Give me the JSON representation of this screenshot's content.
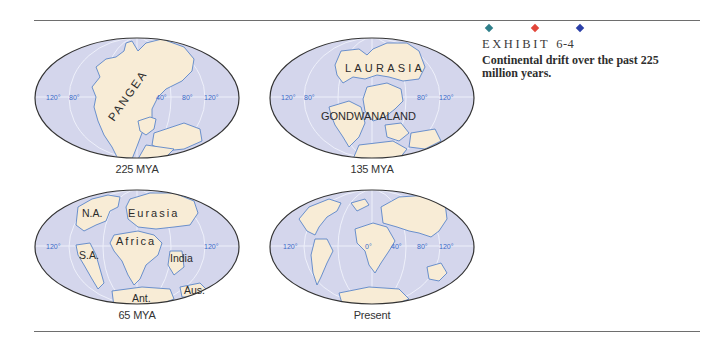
{
  "exhibit": {
    "label": "EXHIBIT",
    "number": "6-4",
    "caption": "Continental drift over the past 225 million years.",
    "diamond_colors": [
      "#2f7f8a",
      "#e2463a",
      "#2b3fa8"
    ]
  },
  "colors": {
    "ocean": "#d4d6ec",
    "land": "#f8ecd6",
    "coastline": "#5b86c8",
    "gridline": "#eef0fa",
    "longitude_label": "#3a6ac8",
    "outline": "#333333"
  },
  "maps": [
    {
      "caption": "225 MYA",
      "longitude_labels": [
        "120°",
        "80°",
        "40°",
        "80°",
        "120°"
      ],
      "region_labels": [
        "PANGEA"
      ]
    },
    {
      "caption": "135 MYA",
      "longitude_labels": [
        "120°",
        "80°",
        "80°",
        "120°"
      ],
      "region_labels": [
        "LAURASIA",
        "GONDWANALAND"
      ]
    },
    {
      "caption": "65 MYA",
      "longitude_labels": [
        "120°",
        "120°"
      ],
      "region_labels": [
        "N.A.",
        "Eurasia",
        "Africa",
        "S.A.",
        "India",
        "Aus.",
        "Ant."
      ]
    },
    {
      "caption": "Present",
      "longitude_labels": [
        "120°",
        "0°",
        "40°",
        "80°",
        "120°"
      ],
      "region_labels": []
    }
  ]
}
